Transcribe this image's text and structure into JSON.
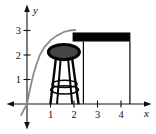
{
  "figure": {
    "background": "#ffffff",
    "axes": {
      "x_label": "x",
      "y_label": "y",
      "color": "#111111",
      "x_tick_values": [
        1,
        2,
        3,
        4
      ],
      "x_tick_labels": [
        "1",
        "2",
        "3",
        "4"
      ],
      "y_tick_values": [
        1,
        2,
        3
      ],
      "y_tick_labels": [
        "1",
        "2",
        "3"
      ]
    },
    "curve": {
      "color": "#8c8c8c",
      "stroke_width": 1.8,
      "points": [
        [
          -0.25,
          -0.45
        ],
        [
          0,
          0
        ],
        [
          0.13,
          0.62
        ],
        [
          0.27,
          1.2
        ],
        [
          0.42,
          1.66
        ],
        [
          0.55,
          2.0
        ],
        [
          0.75,
          2.33
        ],
        [
          1.0,
          2.6
        ],
        [
          1.25,
          2.78
        ],
        [
          1.55,
          2.93
        ],
        [
          1.8,
          3.0
        ],
        [
          2.05,
          3.02
        ]
      ],
      "peak": [
        2,
        3
      ]
    },
    "counter": {
      "color": "#050505",
      "top": {
        "x_left": 1.94,
        "x_right": 4.4,
        "y_top": 2.92,
        "y_bottom": 2.55
      },
      "left_leg_x": 2.4,
      "right_leg_x": 4.38,
      "leg_stroke_width": 1.2
    },
    "stool": {
      "color": "#050505",
      "seat": {
        "cx": 1.57,
        "cy": 2.12,
        "rx": 0.66,
        "ry": 0.31,
        "fill": "#454545",
        "rim_width": 3
      },
      "legs": [
        {
          "x1": 1.23,
          "y1": 1.86,
          "x2": 1.0,
          "y2": 0.03,
          "w": 2.4
        },
        {
          "x1": 1.43,
          "y1": 1.82,
          "x2": 1.28,
          "y2": 0.03,
          "w": 2.0
        },
        {
          "x1": 1.75,
          "y1": 1.82,
          "x2": 1.92,
          "y2": 0.03,
          "w": 2.0
        },
        {
          "x1": 1.92,
          "y1": 1.86,
          "x2": 2.19,
          "y2": 0.03,
          "w": 2.4
        }
      ],
      "footrests": [
        {
          "cx": 1.6,
          "cy": 0.82,
          "rx": 0.53,
          "ry": 0.147
        },
        {
          "cx": 1.6,
          "cy": 0.58,
          "rx": 0.59,
          "ry": 0.167
        }
      ],
      "footrest_stroke_width": 1.5
    }
  }
}
